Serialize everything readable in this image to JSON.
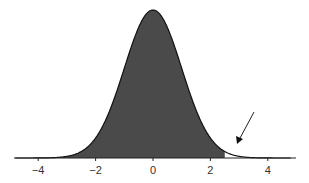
{
  "chart_data": {
    "type": "area",
    "title": "",
    "xlabel": "",
    "ylabel": "",
    "distribution": {
      "name": "standard normal",
      "mean": 0,
      "sd": 1
    },
    "xlim": [
      -4.8,
      4.8
    ],
    "x_ticks": [
      -4,
      -2,
      0,
      2,
      4
    ],
    "x_tick_labels": [
      "−4",
      "−2",
      "0",
      "2",
      "4"
    ],
    "shaded_region": {
      "from": -4.8,
      "to": 2.5,
      "color": "#4a4a4a"
    },
    "unshaded_tail": {
      "from": 2.5,
      "to": 4.8
    },
    "annotation": {
      "type": "arrow",
      "points_to_x": 2.9,
      "label": ""
    },
    "grid": false,
    "legend": null
  },
  "colors": {
    "fill": "#4a4a4a",
    "curve": "#111111",
    "axis": "#222222"
  }
}
